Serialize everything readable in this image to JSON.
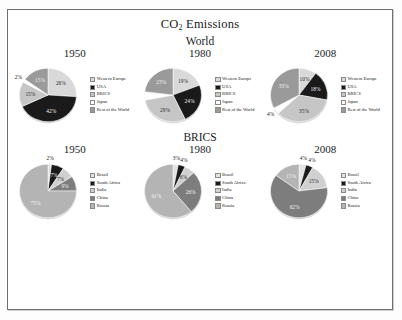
{
  "figure": {
    "title": "CO",
    "title_sub": "2",
    "title_tail": " Emissions",
    "section_world": "World",
    "section_brics": "BRICS"
  },
  "palette": {
    "western_europe": "#d9d9d9",
    "usa": "#1a1a1a",
    "brics": "#c6c6c6",
    "japan": "#ffffff",
    "rest_of_world": "#9a9a9a",
    "brazil": "#e2e2e2",
    "south_africa": "#1a1a1a",
    "india": "#d0d0d0",
    "china": "#7d7d7d",
    "russia": "#b4b4b4"
  },
  "chart_data": [
    {
      "type": "pie",
      "title": "1950",
      "group": "World",
      "categories": [
        "Western Europe",
        "USA",
        "BRICS",
        "Japan",
        "Rest of the World"
      ],
      "values": [
        26,
        42,
        15,
        2,
        15
      ],
      "labels": [
        "26%",
        "42%",
        "15%",
        "2%",
        "15%"
      ],
      "colors": [
        "#d9d9d9",
        "#1a1a1a",
        "#c6c6c6",
        "#ffffff",
        "#9a9a9a"
      ],
      "label_place": [
        "in",
        "in",
        "in",
        "out",
        "in"
      ],
      "label_tone": [
        "dark-text",
        "light-text",
        "dark-text",
        "dark-text",
        "light-text"
      ]
    },
    {
      "type": "pie",
      "title": "1980",
      "group": "World",
      "categories": [
        "Western Europe",
        "USA",
        "BRICS",
        "Japan",
        "Rest of the World"
      ],
      "values": [
        19,
        24,
        29,
        5,
        23
      ],
      "labels": [
        "19%",
        "24%",
        "29%",
        "5%",
        "23%"
      ],
      "colors": [
        "#d9d9d9",
        "#1a1a1a",
        "#c6c6c6",
        "#ffffff",
        "#9a9a9a"
      ],
      "label_place": [
        "in",
        "in",
        "in",
        "in",
        "in"
      ],
      "label_tone": [
        "dark-text",
        "light-text",
        "dark-text",
        "light-text",
        "light-text"
      ]
    },
    {
      "type": "pie",
      "title": "2008",
      "group": "World",
      "categories": [
        "Western Europe",
        "USA",
        "BRICS",
        "Japan",
        "Rest of the World"
      ],
      "values": [
        10,
        18,
        35,
        4,
        33
      ],
      "labels": [
        "10%",
        "18%",
        "35%",
        "4%",
        "33%"
      ],
      "colors": [
        "#d9d9d9",
        "#1a1a1a",
        "#c6c6c6",
        "#ffffff",
        "#9a9a9a"
      ],
      "label_place": [
        "in",
        "in",
        "in",
        "out",
        "in"
      ],
      "label_tone": [
        "dark-text",
        "light-text",
        "dark-text",
        "dark-text",
        "light-text"
      ]
    },
    {
      "type": "pie",
      "title": "1950",
      "group": "BRICS",
      "categories": [
        "Brazil",
        "South Africa",
        "India",
        "China",
        "Russia"
      ],
      "values": [
        2,
        7,
        7,
        9,
        75
      ],
      "labels": [
        "2%",
        "7%",
        "7%",
        "9%",
        "75%"
      ],
      "colors": [
        "#e2e2e2",
        "#1a1a1a",
        "#d0d0d0",
        "#7d7d7d",
        "#b4b4b4"
      ],
      "label_place": [
        "out",
        "in",
        "in",
        "in",
        "in"
      ],
      "label_tone": [
        "dark-text",
        "light-text",
        "dark-text",
        "light-text",
        "light-text"
      ]
    },
    {
      "type": "pie",
      "title": "1980",
      "group": "BRICS",
      "categories": [
        "Brazil",
        "South Africa",
        "India",
        "China",
        "Russia"
      ],
      "values": [
        3,
        4,
        6,
        26,
        61
      ],
      "labels": [
        "3%",
        "4%",
        "6%",
        "26%",
        "61%"
      ],
      "colors": [
        "#e2e2e2",
        "#1a1a1a",
        "#d0d0d0",
        "#7d7d7d",
        "#b4b4b4"
      ],
      "label_place": [
        "out",
        "out",
        "in",
        "in",
        "in"
      ],
      "label_tone": [
        "dark-text",
        "dark-text",
        "dark-text",
        "light-text",
        "light-text"
      ]
    },
    {
      "type": "pie",
      "title": "2008",
      "group": "BRICS",
      "categories": [
        "Brazil",
        "South Africa",
        "India",
        "China",
        "Russia"
      ],
      "values": [
        4,
        4,
        15,
        62,
        15
      ],
      "labels": [
        "4%",
        "4%",
        "15%",
        "62%",
        "15%"
      ],
      "colors": [
        "#e2e2e2",
        "#1a1a1a",
        "#d0d0d0",
        "#7d7d7d",
        "#b4b4b4"
      ],
      "label_place": [
        "out",
        "out",
        "in",
        "in",
        "in"
      ],
      "label_tone": [
        "dark-text",
        "dark-text",
        "dark-text",
        "light-text",
        "light-text"
      ]
    }
  ]
}
